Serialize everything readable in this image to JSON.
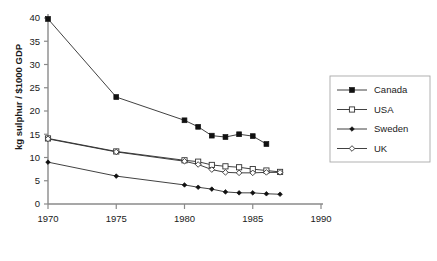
{
  "chart_data": {
    "type": "line",
    "title": "",
    "subtitle": "",
    "xlabel": "",
    "ylabel": "kg sulphur / $1000 GDP",
    "xlim": [
      1970,
      1990
    ],
    "ylim": [
      0,
      40
    ],
    "xticks": [
      1970,
      1975,
      1980,
      1985,
      1990
    ],
    "xtick_labels": [
      "1970",
      "1975",
      "1980",
      "1985",
      "1990"
    ],
    "yticks": [
      0,
      5,
      10,
      15,
      20,
      25,
      30,
      35,
      40
    ],
    "ytick_labels": [
      "0",
      "5",
      "10",
      "15",
      "20",
      "25",
      "30",
      "35",
      "40"
    ],
    "grid": false,
    "legend_position": "right-outside",
    "series": [
      {
        "name": "Canada",
        "marker": "filled-square",
        "color": "#111111",
        "x": [
          1970,
          1975,
          1980,
          1981,
          1982,
          1983,
          1984,
          1985,
          1986
        ],
        "values": [
          39.8,
          23.0,
          18.0,
          16.6,
          14.7,
          14.4,
          15.0,
          14.6,
          12.9
        ]
      },
      {
        "name": "USA",
        "marker": "open-square",
        "color": "#333333",
        "x": [
          1970,
          1975,
          1980,
          1981,
          1982,
          1983,
          1984,
          1985,
          1986,
          1987
        ],
        "values": [
          14.1,
          11.3,
          9.4,
          9.1,
          8.4,
          8.1,
          7.9,
          7.5,
          7.2,
          6.9
        ]
      },
      {
        "name": "Sweden",
        "marker": "filled-diamond",
        "color": "#111111",
        "x": [
          1970,
          1975,
          1980,
          1981,
          1982,
          1983,
          1984,
          1985,
          1986,
          1987
        ],
        "values": [
          9.0,
          6.0,
          4.1,
          3.6,
          3.2,
          2.6,
          2.4,
          2.4,
          2.2,
          2.1
        ]
      },
      {
        "name": "UK",
        "marker": "open-diamond",
        "color": "#333333",
        "x": [
          1970,
          1975,
          1980,
          1981,
          1982,
          1983,
          1984,
          1985,
          1986,
          1987
        ],
        "values": [
          14.0,
          11.2,
          9.2,
          8.5,
          7.4,
          6.8,
          6.7,
          6.7,
          6.8,
          6.8
        ]
      }
    ]
  },
  "legend": {
    "items": [
      {
        "label": "Canada"
      },
      {
        "label": "USA"
      },
      {
        "label": "Sweden"
      },
      {
        "label": "UK"
      }
    ]
  }
}
